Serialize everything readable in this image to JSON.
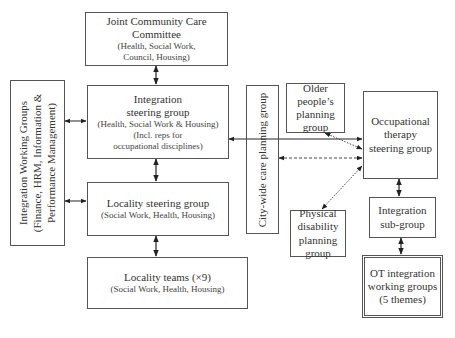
{
  "diagram": {
    "nodes": {
      "joint_committee": {
        "title_1": "Joint Community Care",
        "title_2": "Committee",
        "sub_1": "(Health, Social Work,",
        "sub_2": "Council, Housing)"
      },
      "integration_steering": {
        "title_1": "Integration",
        "title_2": "steering group",
        "sub_1": "(Health, Social Work & Housing)",
        "sub_2": "(Incl. reps for",
        "sub_3": "occupational disciplines)"
      },
      "locality_steering": {
        "title": "Locality steering group",
        "sub": "(Social Work, Health, Housing)"
      },
      "locality_teams": {
        "title": "Locality teams (×9)",
        "sub": "(Social Work, Health, Housing)"
      },
      "integration_working_groups": {
        "line_1": "Integration Working Groups",
        "line_2": "(Finance, HRM, Information &",
        "line_3": "Performance Management)"
      },
      "city_wide": {
        "label": "City-wide care planning group"
      },
      "older_people": {
        "line_1": "Older people’s",
        "line_2": "planning",
        "line_3": "group"
      },
      "physical_disability": {
        "line_1": "Physical",
        "line_2": "disability",
        "line_3": "planning",
        "line_4": "group"
      },
      "ot_steering": {
        "line_1": "Occupational",
        "line_2": "therapy",
        "line_3": "steering group"
      },
      "integration_subgroup": {
        "line_1": "Integration",
        "line_2": "sub-group"
      },
      "ot_working_groups": {
        "line_1": "OT integration",
        "line_2": "working groups",
        "line_3": "(5 themes)"
      }
    },
    "edges": [
      {
        "from": "joint_committee",
        "to": "integration_steering",
        "style": "solid",
        "direction": "both"
      },
      {
        "from": "integration_steering",
        "to": "locality_steering",
        "style": "solid",
        "direction": "both"
      },
      {
        "from": "locality_steering",
        "to": "locality_teams",
        "style": "solid",
        "direction": "both"
      },
      {
        "from": "integration_working_groups",
        "to": "integration_steering",
        "style": "solid",
        "direction": "both"
      },
      {
        "from": "integration_working_groups",
        "to": "locality_steering",
        "style": "solid",
        "direction": "both"
      },
      {
        "from": "ot_steering",
        "to": "integration_steering",
        "style": "solid",
        "direction": "both"
      },
      {
        "from": "ot_steering",
        "to": "city_wide",
        "style": "dashed",
        "direction": "both"
      },
      {
        "from": "ot_steering",
        "to": "older_people",
        "style": "dotted",
        "direction": "both"
      },
      {
        "from": "ot_steering",
        "to": "physical_disability",
        "style": "dotted",
        "direction": "both"
      },
      {
        "from": "ot_steering",
        "to": "integration_subgroup",
        "style": "solid",
        "direction": "both"
      },
      {
        "from": "integration_subgroup",
        "to": "ot_working_groups",
        "style": "solid",
        "direction": "both"
      }
    ]
  }
}
